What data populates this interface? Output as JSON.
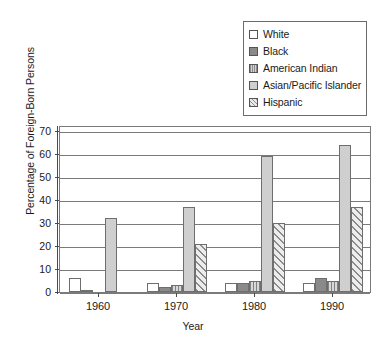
{
  "chart_data": {
    "type": "bar",
    "title": "",
    "xlabel": "Year",
    "ylabel": "Percentage of Foreign-Born Persons",
    "categories": [
      "1960",
      "1970",
      "1980",
      "1990"
    ],
    "ylim": [
      0,
      70
    ],
    "yticks": [
      0,
      10,
      20,
      30,
      40,
      50,
      60,
      70
    ],
    "grid": true,
    "legend_position": "top-right",
    "series": [
      {
        "name": "White",
        "values": [
          6,
          4,
          4,
          4
        ],
        "swatch": "white"
      },
      {
        "name": "Black",
        "values": [
          1,
          2,
          4,
          6
        ],
        "swatch": "solid-dark-gray"
      },
      {
        "name": "American Indian",
        "values": [
          0,
          3,
          5,
          5
        ],
        "swatch": "vertical-stripes"
      },
      {
        "name": "Asian/Pacific Islander",
        "values": [
          32,
          37,
          59,
          64
        ],
        "swatch": "solid-light-gray"
      },
      {
        "name": "Hispanic",
        "values": [
          0,
          21,
          30,
          37
        ],
        "swatch": "diagonal-hatch"
      }
    ]
  },
  "legend": {
    "items": [
      {
        "label": "White"
      },
      {
        "label": "Black"
      },
      {
        "label": "American Indian"
      },
      {
        "label": "Asian/Pacific Islander"
      },
      {
        "label": "Hispanic"
      }
    ]
  },
  "axes": {
    "y_title": "Percentage of Foreign-Born Persons",
    "x_title": "Year",
    "y_tick_labels": [
      "70",
      "60",
      "50",
      "40",
      "30",
      "20",
      "10",
      "0"
    ],
    "x_tick_labels": [
      "1960",
      "1970",
      "1980",
      "1990"
    ]
  },
  "colors": {
    "frame": "#7a7a7a",
    "text": "#1a1a1a",
    "bar_dark": "#8a8a8a",
    "bar_light": "#cfcfcf"
  }
}
